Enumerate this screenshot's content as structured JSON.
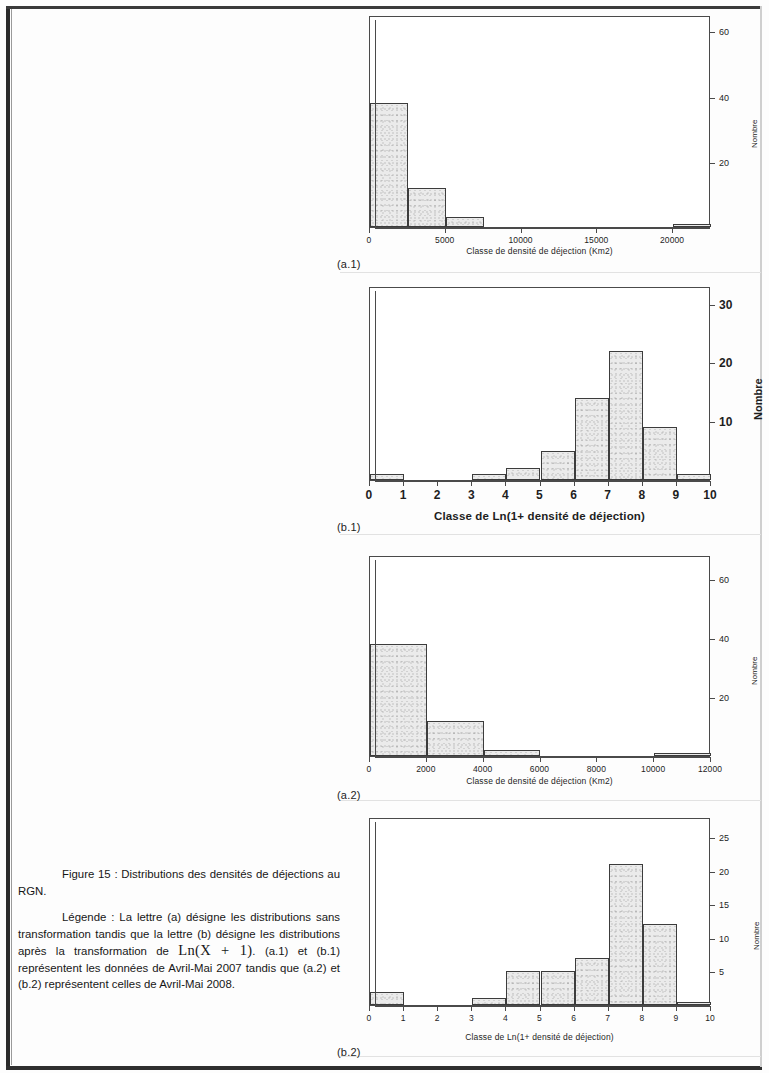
{
  "caption": {
    "figure_title": "Figure 15 : Distributions des densités de déjections au RGN.",
    "legend_part1": "Légende : La lettre (a) désigne les distributions sans transformation tandis que la lettre (b) désigne les distributions après la transformation de ",
    "legend_math": "Ln(X + 1)",
    "legend_part2": ". (a.1) et (b.1) représentent les données de Avril-Mai 2007 tandis que (a.2) et (b.2) représentent celles de Avril-Mai 2008."
  },
  "subfigure_labels": {
    "a1": "(a.1)",
    "b1": "(b.1)",
    "a2": "(a.2)",
    "b2": "(b.2)"
  },
  "chart_data": [
    {
      "id": "a1",
      "type": "bar",
      "title": "",
      "xlabel": "Classe de densité de déjection (Km2)",
      "ylabel": "Nombre",
      "xlim": [
        0,
        22500
      ],
      "ylim": [
        0,
        65
      ],
      "xticks": [
        0,
        5000,
        10000,
        15000,
        20000
      ],
      "xticklabels": [
        "0",
        "5000",
        "10000",
        "15000",
        "20000"
      ],
      "yticks": [
        20,
        40,
        60
      ],
      "yticklabels": [
        "20",
        "40",
        "60"
      ],
      "grid": false,
      "bin_width": 2500,
      "bin_edges": [
        0,
        2500,
        5000,
        7500,
        10000,
        12500,
        15000,
        17500,
        20000,
        22500
      ],
      "values": [
        38,
        12,
        3,
        0,
        0,
        0,
        0,
        0,
        1
      ]
    },
    {
      "id": "b1",
      "type": "bar",
      "title": "",
      "xlabel": "Classe de Ln(1+ densité de déjection)",
      "ylabel": "Nombre",
      "xlim": [
        0,
        10
      ],
      "ylim": [
        0,
        33
      ],
      "xticks": [
        0,
        1,
        2,
        3,
        4,
        5,
        6,
        7,
        8,
        9,
        10
      ],
      "xticklabels": [
        "0",
        "1",
        "2",
        "3",
        "4",
        "5",
        "6",
        "7",
        "8",
        "9",
        "10"
      ],
      "yticks": [
        10,
        20,
        30
      ],
      "yticklabels": [
        "10",
        "20",
        "30"
      ],
      "grid": false,
      "bin_width": 1,
      "bin_edges": [
        0,
        1,
        2,
        3,
        4,
        5,
        6,
        7,
        8,
        9,
        10
      ],
      "values": [
        1,
        0,
        0,
        1,
        2,
        5,
        14,
        22,
        9,
        1
      ]
    },
    {
      "id": "a2",
      "type": "bar",
      "title": "",
      "xlabel": "Classe de densité de déjection (Km2)",
      "ylabel": "Nombre",
      "xlim": [
        0,
        12000
      ],
      "ylim": [
        0,
        68
      ],
      "xticks": [
        0,
        2000,
        4000,
        6000,
        8000,
        10000,
        12000
      ],
      "xticklabels": [
        "0",
        "2000",
        "4000",
        "6000",
        "8000",
        "10000",
        "12000"
      ],
      "yticks": [
        20,
        40,
        60
      ],
      "yticklabels": [
        "20",
        "40",
        "60"
      ],
      "grid": false,
      "bin_width": 2000,
      "bin_edges": [
        0,
        2000,
        4000,
        6000,
        8000,
        10000,
        12000
      ],
      "values": [
        38,
        12,
        2,
        0,
        0,
        1
      ]
    },
    {
      "id": "b2",
      "type": "bar",
      "title": "",
      "xlabel": "Classe de Ln(1+ densité de déjection)",
      "ylabel": "Nombre",
      "xlim": [
        0,
        10
      ],
      "ylim": [
        0,
        28
      ],
      "xticks": [
        0,
        1,
        2,
        3,
        4,
        5,
        6,
        7,
        8,
        9,
        10
      ],
      "xticklabels": [
        "0",
        "1",
        "2",
        "3",
        "4",
        "5",
        "6",
        "7",
        "8",
        "9",
        "10"
      ],
      "yticks": [
        5,
        10,
        15,
        20,
        25
      ],
      "yticklabels": [
        "5",
        "10",
        "15",
        "20",
        "25"
      ],
      "grid": false,
      "bin_width": 1,
      "bin_edges": [
        0,
        1,
        2,
        3,
        4,
        5,
        6,
        7,
        8,
        9,
        10
      ],
      "values": [
        2,
        0,
        0,
        1,
        5,
        5,
        7,
        21,
        12,
        0.5
      ]
    }
  ]
}
